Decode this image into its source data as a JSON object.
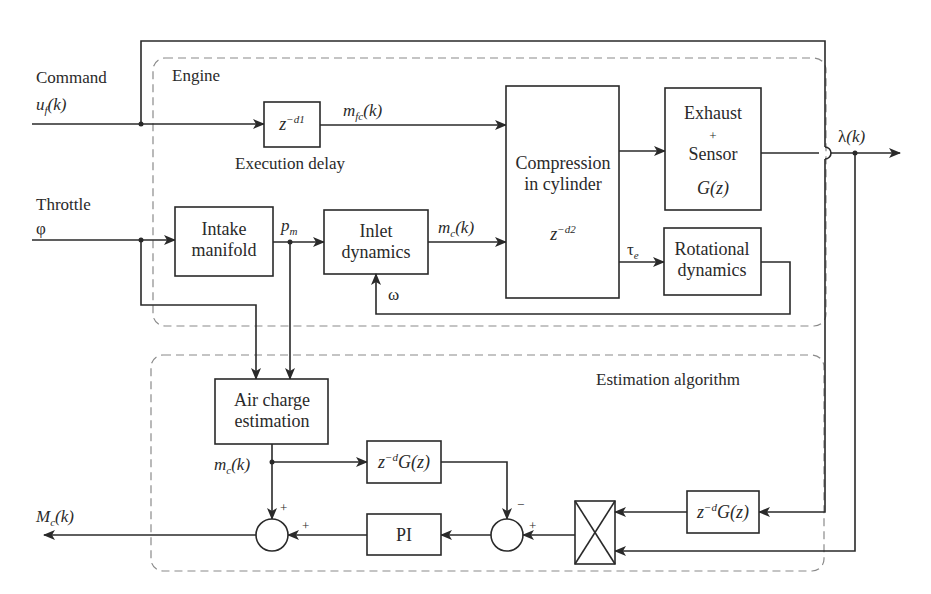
{
  "diagram": {
    "inputs": {
      "command_label": "Command",
      "command_signal": "u",
      "command_signal_sub": "f",
      "command_signal_arg": "(k)",
      "throttle_label": "Throttle",
      "throttle_signal": "φ"
    },
    "output": {
      "signal": "M",
      "signal_sub": "c",
      "signal_arg": "(k)"
    },
    "groups": {
      "engine": "Engine",
      "estimation": "Estimation algorithm"
    },
    "blocks": {
      "execution_delay": {
        "base": "z",
        "exp": "−d1",
        "caption": "Execution delay"
      },
      "intake_manifold": {
        "line1": "Intake",
        "line2": "manifold"
      },
      "inlet_dynamics": {
        "line1": "Inlet",
        "line2": "dynamics"
      },
      "compression": {
        "line1": "Compression",
        "line2": "in cylinder",
        "base": "z",
        "exp": "−d2"
      },
      "exhaust_sensor": {
        "line1": "Exhaust",
        "line2": "+",
        "line3": "Sensor",
        "tf": "G(z)"
      },
      "rotational": {
        "line1": "Rotational",
        "line2": "dynamics"
      },
      "air_charge": {
        "line1": "Air charge",
        "line2": "estimation"
      },
      "model_delay_top": {
        "base": "z",
        "exp": "−d",
        "tf": "G(z)"
      },
      "model_delay_right": {
        "base": "z",
        "exp": "−d",
        "tf": "G(z)"
      },
      "pi": {
        "label": "PI"
      },
      "multiplier": {
        "label": "×"
      }
    },
    "signals": {
      "mfc": {
        "base": "m",
        "sub": "fc",
        "arg": "(k)"
      },
      "pm": {
        "base": "p",
        "sub": "m"
      },
      "mc_engine": {
        "base": "m",
        "sub": "c",
        "arg": "(k)"
      },
      "tau_e": {
        "base": "τ",
        "sub": "e"
      },
      "omega": "ω",
      "lambda": {
        "base": "λ",
        "arg": "(k)"
      },
      "mc_est": {
        "base": "m",
        "sub": "c",
        "arg": "(k)"
      }
    },
    "summing_junctions": {
      "left": {
        "top_sign": "+",
        "right_sign": "+"
      },
      "right": {
        "top_sign": "−",
        "right_sign": "+"
      }
    },
    "colors": {
      "line": "#2a2a2a",
      "dashed_group": "#8a8a8a",
      "background": "#ffffff"
    }
  }
}
